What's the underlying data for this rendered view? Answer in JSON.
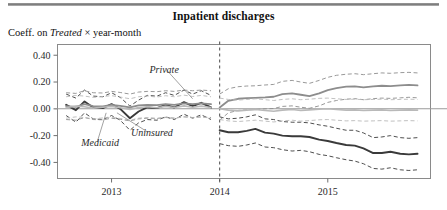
{
  "figure": {
    "title": "Inpatient discharges",
    "subtitle_prefix": "Coeff. on ",
    "subtitle_italic": "Treated",
    "subtitle_suffix": " × year-month"
  },
  "chart_data": {
    "type": "line",
    "title": "Inpatient discharges",
    "subtitle": "Coeff. on Treated × year-month",
    "xlabel": "",
    "ylabel": "Coeff. on Treated × year-month",
    "xlim": [
      2012.5,
      2015.95
    ],
    "ylim": [
      -0.52,
      0.48
    ],
    "yticks": [
      0.4,
      0.2,
      0.0,
      -0.2,
      -0.4
    ],
    "ytick_labels": [
      "0.40",
      "0.20",
      "0.00",
      "-0.20",
      "-0.40"
    ],
    "xticks": [
      2013,
      2014,
      2015
    ],
    "xtick_labels": [
      "2013",
      "2014",
      "2015"
    ],
    "grid": false,
    "legend_position": "inline-annotations",
    "zero_line": 0.0,
    "event_line": {
      "x": 2014.0,
      "style": "dashed",
      "label": ""
    },
    "annotations": [
      {
        "text": "Private",
        "x": 2013.35,
        "y": 0.27,
        "points_to": {
          "x": 2013.75,
          "y": 0.075
        }
      },
      {
        "text": "Uninsured",
        "x": 2013.18,
        "y": -0.2,
        "points_to": {
          "x": 2013.05,
          "y": -0.03
        }
      },
      {
        "text": "Medicaid",
        "x": 2012.72,
        "y": -0.275,
        "points_to": {
          "x": 2012.95,
          "y": -0.03
        }
      }
    ],
    "x": [
      2012.58,
      2012.67,
      2012.75,
      2012.83,
      2012.92,
      2013.0,
      2013.08,
      2013.17,
      2013.25,
      2013.33,
      2013.42,
      2013.5,
      2013.58,
      2013.67,
      2013.75,
      2013.83,
      2013.92,
      2014.0,
      2014.08,
      2014.17,
      2014.25,
      2014.33,
      2014.42,
      2014.5,
      2014.58,
      2014.67,
      2014.75,
      2014.83,
      2014.92,
      2015.0,
      2015.08,
      2015.17,
      2015.25,
      2015.33,
      2015.42,
      2015.5,
      2015.58,
      2015.67,
      2015.75,
      2015.83
    ],
    "series": [
      {
        "name": "Medicaid",
        "style": "solid",
        "color": "#3a3a3a",
        "width": 1.9,
        "values": [
          0.03,
          -0.01,
          0.055,
          0.01,
          0.005,
          0.035,
          0.0,
          -0.07,
          -0.02,
          0.01,
          0.005,
          0.03,
          0.01,
          0.05,
          0.02,
          0.045,
          0.01,
          -0.16,
          -0.175,
          -0.175,
          -0.165,
          -0.15,
          -0.178,
          -0.185,
          -0.2,
          -0.205,
          -0.205,
          -0.21,
          -0.23,
          -0.24,
          -0.255,
          -0.27,
          -0.275,
          -0.295,
          -0.33,
          -0.33,
          -0.32,
          -0.335,
          -0.34,
          -0.335
        ],
        "ci_upper": [
          0.11,
          0.08,
          0.14,
          0.095,
          0.09,
          0.12,
          0.085,
          0.02,
          0.065,
          0.1,
          0.095,
          0.12,
          0.1,
          0.14,
          0.11,
          0.135,
          0.1,
          -0.06,
          -0.075,
          -0.07,
          -0.06,
          -0.045,
          -0.075,
          -0.08,
          -0.095,
          -0.1,
          -0.1,
          -0.105,
          -0.12,
          -0.13,
          -0.145,
          -0.16,
          -0.16,
          -0.18,
          -0.215,
          -0.21,
          -0.2,
          -0.215,
          -0.22,
          -0.215
        ],
        "ci_lower": [
          -0.05,
          -0.1,
          -0.03,
          -0.075,
          -0.08,
          -0.05,
          -0.085,
          -0.16,
          -0.105,
          -0.08,
          -0.085,
          -0.06,
          -0.08,
          -0.04,
          -0.07,
          -0.045,
          -0.08,
          -0.26,
          -0.275,
          -0.28,
          -0.27,
          -0.255,
          -0.285,
          -0.29,
          -0.305,
          -0.315,
          -0.31,
          -0.32,
          -0.34,
          -0.35,
          -0.365,
          -0.38,
          -0.39,
          -0.41,
          -0.445,
          -0.45,
          -0.44,
          -0.455,
          -0.46,
          -0.455
        ]
      },
      {
        "name": "Private",
        "style": "solid",
        "color": "#8d8d8d",
        "width": 1.8,
        "values": [
          0.02,
          0.015,
          0.035,
          0.02,
          0.018,
          0.03,
          0.022,
          0.01,
          0.025,
          0.03,
          0.028,
          0.035,
          0.03,
          0.04,
          0.035,
          0.04,
          0.035,
          0.01,
          0.06,
          0.075,
          0.08,
          0.082,
          0.085,
          0.09,
          0.11,
          0.115,
          0.105,
          0.095,
          0.115,
          0.14,
          0.155,
          0.165,
          0.168,
          0.16,
          0.168,
          0.172,
          0.17,
          0.175,
          0.178,
          0.175
        ],
        "ci_upper": [
          0.12,
          0.115,
          0.135,
          0.12,
          0.118,
          0.13,
          0.122,
          0.11,
          0.125,
          0.13,
          0.128,
          0.135,
          0.13,
          0.14,
          0.135,
          0.14,
          0.135,
          0.11,
          0.15,
          0.165,
          0.17,
          0.172,
          0.178,
          0.182,
          0.205,
          0.212,
          0.2,
          0.19,
          0.212,
          0.235,
          0.25,
          0.258,
          0.262,
          0.255,
          0.262,
          0.268,
          0.265,
          0.27,
          0.272,
          0.268
        ],
        "ci_lower": [
          -0.08,
          -0.085,
          -0.065,
          -0.08,
          -0.082,
          -0.07,
          -0.078,
          -0.09,
          -0.075,
          -0.07,
          -0.072,
          -0.065,
          -0.07,
          -0.06,
          -0.065,
          -0.06,
          -0.065,
          -0.085,
          -0.03,
          -0.012,
          -0.008,
          -0.006,
          0.0,
          0.002,
          0.018,
          0.022,
          0.012,
          0.004,
          0.022,
          0.048,
          0.062,
          0.072,
          0.076,
          0.068,
          0.076,
          0.08,
          0.078,
          0.082,
          0.086,
          0.082
        ]
      },
      {
        "name": "Uninsured",
        "style": "solid",
        "color": "#b9b9b9",
        "width": 1.6,
        "values": [
          0.01,
          0.02,
          0.015,
          0.005,
          0.012,
          0.018,
          0.008,
          -0.005,
          0.01,
          0.015,
          0.008,
          0.018,
          0.01,
          0.022,
          0.012,
          0.02,
          0.01,
          0.0,
          -0.01,
          -0.015,
          -0.01,
          -0.005,
          -0.012,
          -0.018,
          -0.01,
          -0.005,
          -0.012,
          -0.008,
          -0.002,
          0.0,
          -0.005,
          -0.01,
          -0.008,
          -0.012,
          -0.01,
          -0.008,
          -0.012,
          -0.01,
          -0.008,
          -0.01
        ],
        "ci_upper": [
          0.09,
          0.1,
          0.095,
          0.085,
          0.092,
          0.098,
          0.088,
          0.075,
          0.09,
          0.095,
          0.088,
          0.098,
          0.09,
          0.102,
          0.092,
          0.1,
          0.09,
          0.08,
          0.07,
          0.065,
          0.07,
          0.075,
          0.068,
          0.062,
          0.07,
          0.075,
          0.068,
          0.072,
          0.078,
          0.08,
          0.075,
          0.07,
          0.072,
          0.068,
          0.07,
          0.072,
          0.068,
          0.07,
          0.072,
          0.07
        ],
        "ci_lower": [
          -0.07,
          -0.06,
          -0.065,
          -0.075,
          -0.068,
          -0.062,
          -0.072,
          -0.085,
          -0.07,
          -0.065,
          -0.072,
          -0.062,
          -0.07,
          -0.058,
          -0.068,
          -0.06,
          -0.07,
          -0.08,
          -0.09,
          -0.095,
          -0.09,
          -0.085,
          -0.092,
          -0.098,
          -0.09,
          -0.085,
          -0.092,
          -0.088,
          -0.082,
          -0.08,
          -0.085,
          -0.09,
          -0.088,
          -0.092,
          -0.09,
          -0.088,
          -0.092,
          -0.09,
          -0.088,
          -0.09
        ]
      }
    ]
  }
}
